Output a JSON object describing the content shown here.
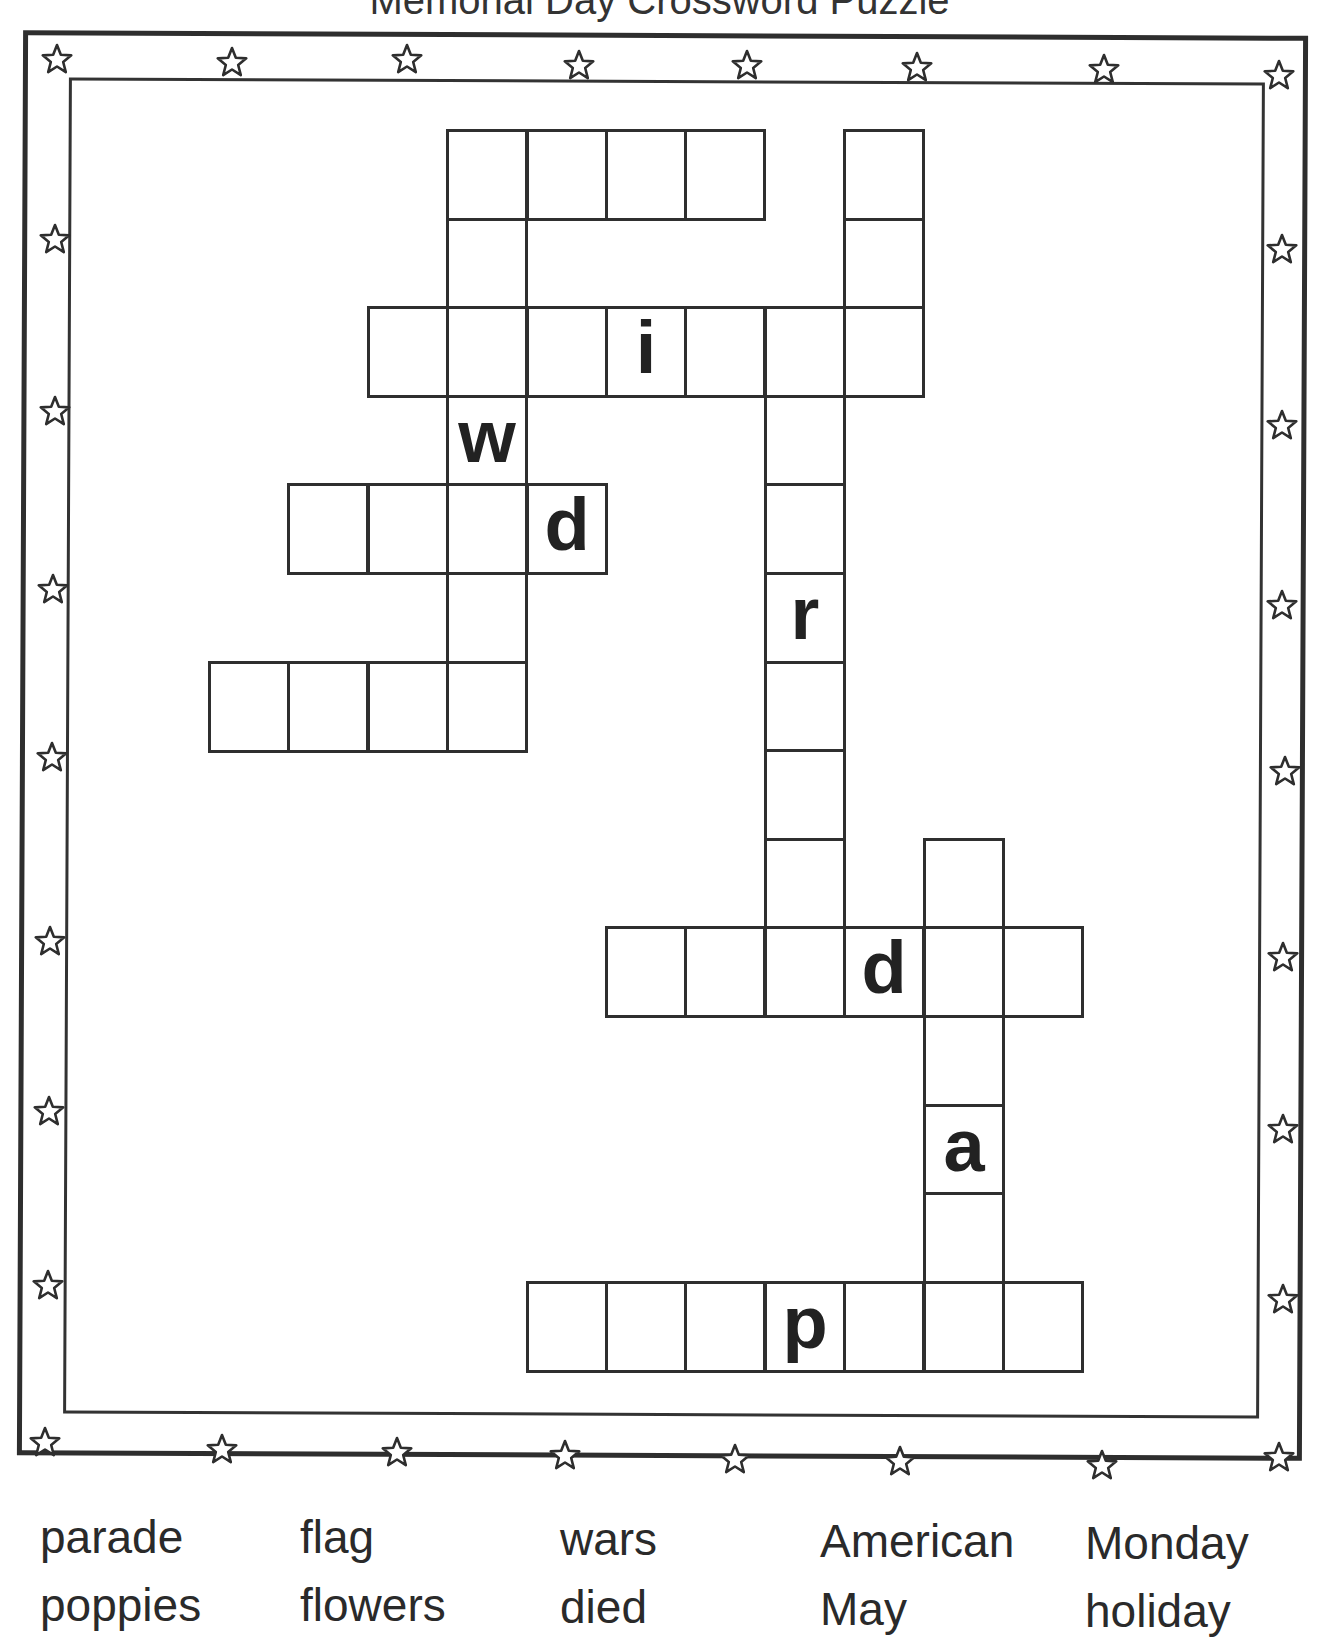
{
  "title": {
    "text": "Memorial Day Crossword Puzzle",
    "note": "top line cut off; only descenders visible"
  },
  "crossword": {
    "origin_x": 208,
    "origin_y": 129,
    "cell_w": 79.4,
    "cell_h": 88.6,
    "rows": 14,
    "cols": 11,
    "cells": [
      {
        "r": 0,
        "c": 3,
        "letter": ""
      },
      {
        "r": 0,
        "c": 4,
        "letter": ""
      },
      {
        "r": 0,
        "c": 5,
        "letter": ""
      },
      {
        "r": 0,
        "c": 6,
        "letter": ""
      },
      {
        "r": 0,
        "c": 8,
        "letter": ""
      },
      {
        "r": 1,
        "c": 3,
        "letter": ""
      },
      {
        "r": 1,
        "c": 8,
        "letter": ""
      },
      {
        "r": 2,
        "c": 2,
        "letter": ""
      },
      {
        "r": 2,
        "c": 3,
        "letter": ""
      },
      {
        "r": 2,
        "c": 4,
        "letter": ""
      },
      {
        "r": 2,
        "c": 5,
        "letter": "i"
      },
      {
        "r": 2,
        "c": 6,
        "letter": ""
      },
      {
        "r": 2,
        "c": 7,
        "letter": ""
      },
      {
        "r": 2,
        "c": 8,
        "letter": ""
      },
      {
        "r": 3,
        "c": 3,
        "letter": "w"
      },
      {
        "r": 3,
        "c": 7,
        "letter": ""
      },
      {
        "r": 4,
        "c": 1,
        "letter": ""
      },
      {
        "r": 4,
        "c": 2,
        "letter": ""
      },
      {
        "r": 4,
        "c": 3,
        "letter": ""
      },
      {
        "r": 4,
        "c": 4,
        "letter": "d"
      },
      {
        "r": 4,
        "c": 7,
        "letter": ""
      },
      {
        "r": 5,
        "c": 3,
        "letter": ""
      },
      {
        "r": 5,
        "c": 7,
        "letter": "r"
      },
      {
        "r": 6,
        "c": 0,
        "letter": ""
      },
      {
        "r": 6,
        "c": 1,
        "letter": ""
      },
      {
        "r": 6,
        "c": 2,
        "letter": ""
      },
      {
        "r": 6,
        "c": 3,
        "letter": ""
      },
      {
        "r": 6,
        "c": 7,
        "letter": ""
      },
      {
        "r": 7,
        "c": 7,
        "letter": ""
      },
      {
        "r": 8,
        "c": 7,
        "letter": ""
      },
      {
        "r": 8,
        "c": 9,
        "letter": ""
      },
      {
        "r": 9,
        "c": 5,
        "letter": ""
      },
      {
        "r": 9,
        "c": 6,
        "letter": ""
      },
      {
        "r": 9,
        "c": 7,
        "letter": ""
      },
      {
        "r": 9,
        "c": 8,
        "letter": "d"
      },
      {
        "r": 9,
        "c": 9,
        "letter": ""
      },
      {
        "r": 9,
        "c": 10,
        "letter": ""
      },
      {
        "r": 10,
        "c": 9,
        "letter": ""
      },
      {
        "r": 11,
        "c": 9,
        "letter": "a"
      },
      {
        "r": 12,
        "c": 9,
        "letter": ""
      },
      {
        "r": 13,
        "c": 4,
        "letter": ""
      },
      {
        "r": 13,
        "c": 5,
        "letter": ""
      },
      {
        "r": 13,
        "c": 6,
        "letter": ""
      },
      {
        "r": 13,
        "c": 7,
        "letter": "p"
      },
      {
        "r": 13,
        "c": 8,
        "letter": ""
      },
      {
        "r": 13,
        "c": 9,
        "letter": ""
      },
      {
        "r": 13,
        "c": 10,
        "letter": ""
      }
    ],
    "given_letters": [
      "i",
      "w",
      "d",
      "r",
      "d",
      "a",
      "p"
    ]
  },
  "border": {
    "star_icon": "star-outline-icon",
    "stars": [
      {
        "x": 40,
        "y": 42
      },
      {
        "x": 215,
        "y": 45
      },
      {
        "x": 390,
        "y": 42
      },
      {
        "x": 562,
        "y": 48
      },
      {
        "x": 730,
        "y": 48
      },
      {
        "x": 900,
        "y": 50
      },
      {
        "x": 1087,
        "y": 52
      },
      {
        "x": 1262,
        "y": 58
      },
      {
        "x": 38,
        "y": 222
      },
      {
        "x": 38,
        "y": 394
      },
      {
        "x": 36,
        "y": 572
      },
      {
        "x": 35,
        "y": 740
      },
      {
        "x": 33,
        "y": 924
      },
      {
        "x": 32,
        "y": 1094
      },
      {
        "x": 31,
        "y": 1268
      },
      {
        "x": 1265,
        "y": 232
      },
      {
        "x": 1265,
        "y": 408
      },
      {
        "x": 1265,
        "y": 588
      },
      {
        "x": 1268,
        "y": 754
      },
      {
        "x": 1266,
        "y": 940
      },
      {
        "x": 1266,
        "y": 1112
      },
      {
        "x": 1266,
        "y": 1282
      },
      {
        "x": 28,
        "y": 1425
      },
      {
        "x": 205,
        "y": 1432
      },
      {
        "x": 380,
        "y": 1435
      },
      {
        "x": 548,
        "y": 1438
      },
      {
        "x": 718,
        "y": 1442
      },
      {
        "x": 883,
        "y": 1444
      },
      {
        "x": 1085,
        "y": 1448
      },
      {
        "x": 1262,
        "y": 1440
      }
    ]
  },
  "word_bank": {
    "columns": [
      {
        "x": 40,
        "words": [
          "parade",
          "poppies"
        ]
      },
      {
        "x": 300,
        "words": [
          "flag",
          "flowers"
        ]
      },
      {
        "x": 560,
        "words": [
          "wars",
          "died"
        ]
      },
      {
        "x": 820,
        "words": [
          "American",
          "May"
        ]
      },
      {
        "x": 1085,
        "words": [
          "Monday",
          "holiday"
        ]
      }
    ],
    "row_y": [
      1510,
      1578
    ]
  }
}
